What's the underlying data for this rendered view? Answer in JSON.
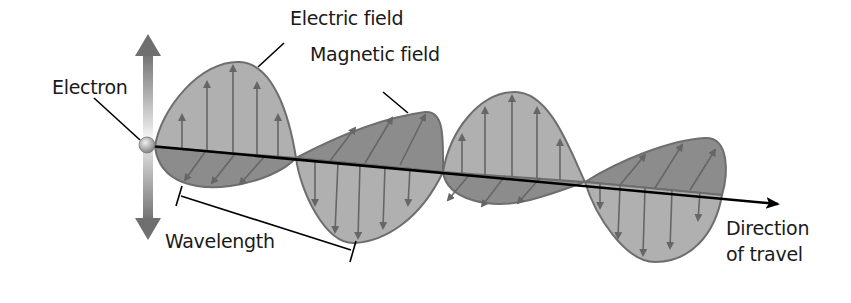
{
  "diagram": {
    "labels": {
      "electron": "Electron",
      "electric_field": "Electric field",
      "magnetic_field": "Magnetic field",
      "wavelength": "Wavelength",
      "direction_line1": "Direction",
      "direction_line2": "of travel"
    },
    "colors": {
      "electric_fill": "#b0b0b0",
      "magnetic_fill": "#8c8c8c",
      "outline": "#6e6e6e",
      "arrow": "#6a6a6a",
      "axis": "#000000",
      "text": "#1a1a1a"
    }
  }
}
